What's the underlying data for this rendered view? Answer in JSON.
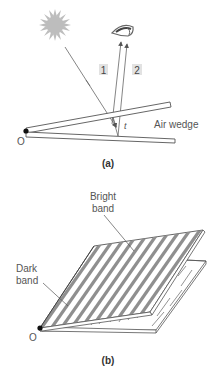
{
  "panel_a": {
    "caption": "(a)",
    "ray_labels": [
      "1",
      "2"
    ],
    "thickness_label": "t",
    "wedge_label": "Air wedge",
    "origin_label": "O",
    "icons": {
      "light_source": "sun-icon",
      "observer": "eye-icon"
    }
  },
  "panel_b": {
    "caption": "(b)",
    "bright_label_line1": "Bright",
    "bright_label_line2": "band",
    "dark_label_line1": "Dark",
    "dark_label_line2": "band",
    "origin_label": "O"
  },
  "colors": {
    "stroke": "#555555",
    "sun": "#bdbdbd",
    "label_box": "#e2e2e2",
    "band": "#8f8f8f"
  }
}
